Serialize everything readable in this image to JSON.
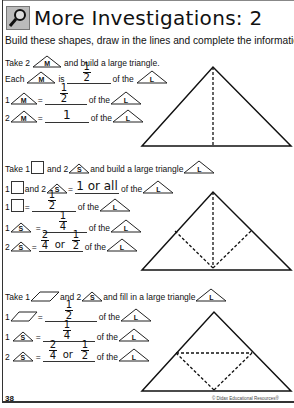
{
  "header": {
    "icon": "magnifier-icon",
    "title": "More Investigations: 2"
  },
  "instructions": "Build these shapes, draw in the lines and complete the information.",
  "sections": [
    {
      "intro": {
        "pre": "Take 2",
        "shape": "M",
        "post": "and build a large triangle."
      },
      "rows": [
        {
          "pre": "Each",
          "shape": "M",
          "mid": "is",
          "answer": "1/2",
          "post": "of the",
          "ref": "L"
        },
        {
          "pre": "1",
          "shape": "M",
          "mid": "=",
          "answer": "1/2",
          "post": "of the",
          "ref": "L"
        },
        {
          "pre": "2",
          "shape": "M",
          "mid": "=",
          "answer": "1",
          "post": "of the",
          "ref": "L"
        }
      ]
    },
    {
      "intro": {
        "pre": "Take 1",
        "shape": "square",
        "mid": "and 2",
        "shape2": "S",
        "post": "and build a large triangle",
        "ref": "L"
      },
      "rows": [
        {
          "pre": "1",
          "shape": "square",
          "mid": "and 2",
          "shape2": "S",
          "eq": "=",
          "answer": "1 or all",
          "post": "of the",
          "ref": "L"
        },
        {
          "pre": "1",
          "shape": "square",
          "mid": "=",
          "answer": "1/2",
          "post": "of the",
          "ref": "L"
        },
        {
          "pre": "1",
          "shape": "S",
          "mid": "=",
          "answer": "1/4",
          "post": "of the",
          "ref": "L"
        },
        {
          "pre": "2",
          "shape": "S",
          "mid": "=",
          "answer": "2/4 or 1/2",
          "post": "of the",
          "ref": "L"
        }
      ]
    },
    {
      "intro": {
        "pre": "Take 1",
        "shape": "parallelogram",
        "mid": "and 2",
        "shape2": "S",
        "post": "and fill in a large triangle",
        "ref": "L"
      },
      "rows": [
        {
          "pre": "1",
          "shape": "parallelogram",
          "mid": "=",
          "answer": "1/2",
          "post": "of the",
          "ref": "L"
        },
        {
          "pre": "1",
          "shape": "S",
          "mid": "=",
          "answer": "1/4",
          "post": "of the",
          "ref": "L"
        },
        {
          "pre": "2",
          "shape": "S",
          "mid": "=",
          "answer": "2/4 or 1/2",
          "post": "of the",
          "ref": "L"
        }
      ]
    }
  ],
  "labels": {
    "M": "M",
    "S": "S",
    "L": "L",
    "or": "or",
    "one": "1",
    "two": "2",
    "four": "4",
    "one_or_all": "1 or all"
  },
  "footer": {
    "page_number": "38",
    "copyright": "© Didax Educational Resources®"
  }
}
